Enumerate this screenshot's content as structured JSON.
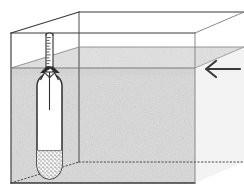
{
  "figure": {
    "caption": "",
    "background_color": "#ffffff",
    "line_color": "#3a3a3a",
    "liquid_color": "#dedede",
    "liquid_shadow_color": "#cfcfcf",
    "instrument_fill": "#ffffff",
    "ballast_color": "#b9b9b9"
  },
  "tank": {
    "name": "rectangular glass tank",
    "front_face": {
      "left_x": 11,
      "right_x": 195,
      "top_y": 33,
      "bottom_y": 183
    },
    "perspective_offset": {
      "dx": 68,
      "dy": -21
    },
    "edges": {
      "top_front": "solid",
      "top_back": "solid",
      "back_vertical_left": "solid",
      "bottom_back": "dotted",
      "bottom_front": "solid"
    }
  },
  "liquid": {
    "name": "liquid",
    "front_surface_y": 68,
    "back_surface_y": 47,
    "fill_color": "#dedede",
    "surface_line_color": "#8a8a8a"
  },
  "hydrometer": {
    "name": "hydrometer",
    "stem": {
      "left_x": 46,
      "right_x": 53,
      "top_y": 34,
      "bottom_y": 72,
      "graduation_count": 12,
      "graduation_side": "left"
    },
    "bulb": {
      "left_x": 37,
      "right_x": 62,
      "top_y": 74,
      "bottom_y": 178,
      "shape": "rounded cylinder"
    },
    "ballast": {
      "label": "lead shot ballast",
      "top_y": 150,
      "bottom_y": 176,
      "pattern": "stippled"
    },
    "meniscus": {
      "label": "meniscus at liquid surface",
      "y": 68,
      "color": "#2e2e2e"
    }
  },
  "arrow": {
    "name": "liquid level indicator arrow",
    "direction": "left",
    "tip_x": 205,
    "tail_x": 240,
    "y": 69,
    "color": "#3a3a3a",
    "label": ""
  }
}
